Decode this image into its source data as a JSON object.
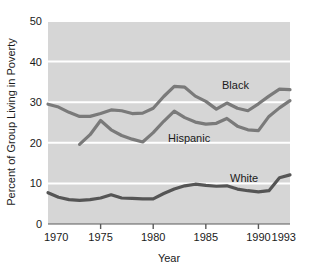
{
  "chart_data": {
    "type": "line",
    "title": "",
    "xlabel": "Year",
    "ylabel": "Percent of Group Living in Poverty",
    "xlim": [
      1970,
      1993
    ],
    "ylim": [
      0,
      50
    ],
    "xticks": [
      1970,
      1975,
      1980,
      1985,
      1990,
      1993
    ],
    "xtick_labels": [
      "1970",
      "1975",
      "1980",
      "1985",
      "1990",
      "1993"
    ],
    "yticks": [
      0,
      10,
      20,
      30,
      40,
      50
    ],
    "ytick_labels": [
      "0",
      "10",
      "20",
      "30",
      "40",
      "50"
    ],
    "grid": "horizontal",
    "grid_color": "#ffffff",
    "plot_background": "#d6d6d6",
    "line_color": "#7a7a7a",
    "legend_position": "inline-labels",
    "series": [
      {
        "name": "Black",
        "label": "Black",
        "color": "#7a7a7a",
        "x": [
          1970,
          1971,
          1972,
          1973,
          1974,
          1975,
          1976,
          1977,
          1978,
          1979,
          1980,
          1981,
          1982,
          1983,
          1984,
          1985,
          1986,
          1987,
          1988,
          1989,
          1990,
          1991,
          1992,
          1993
        ],
        "values": [
          29.5,
          28.8,
          27.5,
          26.5,
          26.5,
          27.2,
          28.1,
          27.9,
          27.2,
          27.3,
          28.5,
          31.4,
          33.9,
          33.7,
          31.5,
          30.2,
          28.3,
          29.8,
          28.5,
          27.9,
          29.6,
          31.5,
          33.2,
          33.1
        ],
        "unit": "percent"
      },
      {
        "name": "Hispanic",
        "label": "Hispanic",
        "color": "#7a7a7a",
        "x": [
          1973,
          1974,
          1975,
          1976,
          1977,
          1978,
          1979,
          1980,
          1981,
          1982,
          1983,
          1984,
          1985,
          1986,
          1987,
          1988,
          1989,
          1990,
          1991,
          1992,
          1993
        ],
        "values": [
          19.6,
          22.0,
          25.5,
          23.2,
          21.8,
          20.9,
          20.2,
          22.5,
          25.3,
          27.8,
          26.2,
          25.1,
          24.6,
          24.8,
          26.0,
          24.1,
          23.2,
          23.0,
          26.5,
          28.6,
          30.4
        ],
        "unit": "percent"
      },
      {
        "name": "White",
        "label": "White",
        "color": "#555555",
        "x": [
          1970,
          1971,
          1972,
          1973,
          1974,
          1975,
          1976,
          1977,
          1978,
          1979,
          1980,
          1981,
          1982,
          1983,
          1984,
          1985,
          1986,
          1987,
          1988,
          1989,
          1990,
          1991,
          1992,
          1993
        ],
        "values": [
          7.7,
          6.6,
          6.0,
          5.8,
          6.0,
          6.4,
          7.2,
          6.4,
          6.3,
          6.2,
          6.2,
          7.5,
          8.6,
          9.4,
          9.8,
          9.5,
          9.3,
          9.4,
          8.6,
          8.2,
          7.9,
          8.2,
          11.4,
          12.1
        ],
        "unit": "percent"
      }
    ]
  },
  "axes": {
    "x_title": "Year",
    "y_title": "Percent of Group Living in Poverty"
  }
}
